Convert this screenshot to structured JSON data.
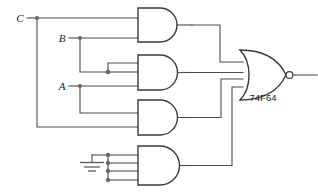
{
  "diagram": {
    "chip_label": "74F64",
    "background_color": "#ffffff",
    "wire_color": "#4c4c4c",
    "gate_outline_color": "#3a3a3a",
    "junction_color": "#6a6a6a",
    "text_color": "#1a1a1a"
  },
  "inputs": [
    {
      "name": "input-label-c",
      "label": "C",
      "x": 20,
      "y": 21
    },
    {
      "name": "input-label-b",
      "label": "B",
      "x": 62,
      "y": 41
    },
    {
      "name": "input-label-a",
      "label": "A",
      "x": 62,
      "y": 89
    }
  ],
  "ground": {
    "name": "ground-symbol",
    "label": "GND"
  },
  "and_gates": [
    {
      "name": "and-gate-1",
      "inputs": 2,
      "label": ""
    },
    {
      "name": "and-gate-2",
      "inputs": 3,
      "label": ""
    },
    {
      "name": "and-gate-3",
      "inputs": 2,
      "label": ""
    },
    {
      "name": "and-gate-4",
      "inputs": 4,
      "label": ""
    }
  ],
  "or_gate": {
    "name": "nor-gate-output",
    "label": "74F64",
    "inverted": true,
    "inputs": 4
  },
  "output": {
    "name": "output-wire",
    "label": ""
  }
}
